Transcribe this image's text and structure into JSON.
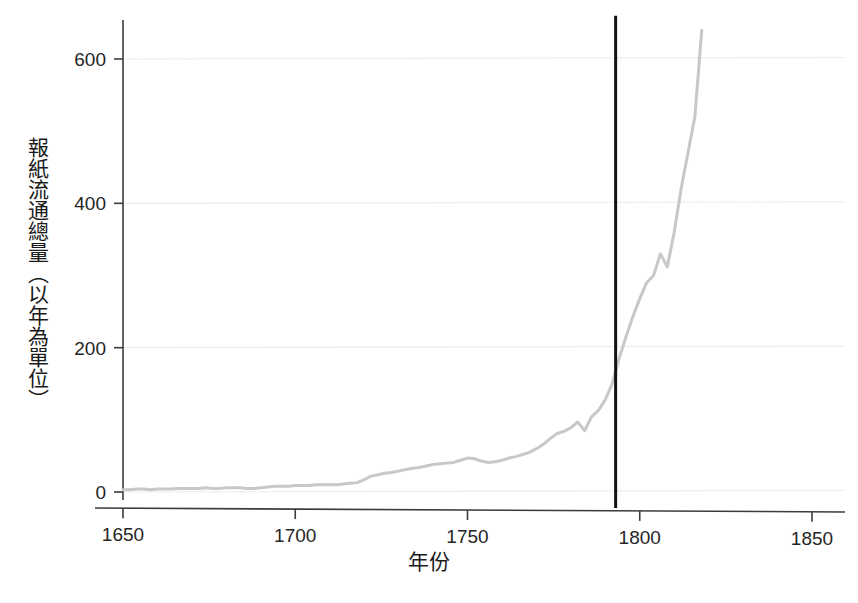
{
  "chart_data": {
    "type": "line",
    "title": "",
    "subtitle": "",
    "xlabel": "年份",
    "ylabel": "報紙流通總量（以年為單位）",
    "xlim": [
      1650,
      1850
    ],
    "ylim": [
      0,
      660
    ],
    "xticks": [
      1650,
      1700,
      1750,
      1800,
      1850
    ],
    "xticklabels": [
      "1650",
      "1700",
      "1750",
      "1800",
      "1850"
    ],
    "yticks": [
      0,
      200,
      400,
      600
    ],
    "yticklabels": [
      "0",
      "200",
      "400",
      "600"
    ],
    "grid": true,
    "grid_axis": "y",
    "legend": null,
    "legend_position": "none",
    "line_color": "#c8c8c8",
    "line_width": 3,
    "annotation_color": "#111111",
    "axis_color": "#3c3c3c",
    "grid_color": "#ededed",
    "background_color": "#ffffff",
    "annotations": [
      {
        "name": "vertical-marker",
        "type": "vline",
        "x": 1793,
        "y_range": [
          0,
          660
        ],
        "color": "#111111",
        "width": 3,
        "label": ""
      }
    ],
    "series": [
      {
        "name": "newspaper-circulation",
        "color": "#c8c8c8",
        "x": [
          1650,
          1652,
          1654,
          1656,
          1658,
          1660,
          1662,
          1664,
          1666,
          1668,
          1670,
          1672,
          1674,
          1676,
          1678,
          1680,
          1682,
          1684,
          1686,
          1688,
          1690,
          1692,
          1694,
          1696,
          1698,
          1700,
          1702,
          1704,
          1706,
          1708,
          1710,
          1712,
          1714,
          1716,
          1718,
          1720,
          1722,
          1724,
          1726,
          1728,
          1730,
          1732,
          1734,
          1736,
          1738,
          1740,
          1742,
          1744,
          1746,
          1748,
          1750,
          1752,
          1754,
          1756,
          1758,
          1760,
          1762,
          1764,
          1766,
          1768,
          1770,
          1772,
          1774,
          1776,
          1778,
          1780,
          1782,
          1784,
          1786,
          1788,
          1790,
          1792,
          1794,
          1796,
          1798,
          1800,
          1802,
          1804,
          1806,
          1808,
          1810,
          1812,
          1814,
          1816,
          1818
        ],
        "y": [
          3,
          3,
          4,
          4,
          3,
          4,
          4,
          4,
          5,
          5,
          5,
          5,
          6,
          5,
          5,
          6,
          6,
          6,
          5,
          5,
          6,
          7,
          8,
          8,
          8,
          9,
          9,
          9,
          10,
          10,
          10,
          10,
          11,
          12,
          13,
          17,
          22,
          24,
          26,
          27,
          29,
          31,
          33,
          34,
          36,
          38,
          39,
          40,
          41,
          44,
          47,
          46,
          43,
          41,
          42,
          44,
          47,
          49,
          52,
          55,
          60,
          66,
          74,
          81,
          84,
          89,
          97,
          85,
          104,
          113,
          128,
          150,
          185,
          215,
          243,
          268,
          290,
          300,
          330,
          312,
          360,
          420,
          470,
          520,
          640
        ]
      }
    ]
  },
  "axes": {
    "x_tick_labels": [
      "1650",
      "1700",
      "1750",
      "1800",
      "1850"
    ],
    "y_tick_labels": [
      "0",
      "200",
      "400",
      "600"
    ],
    "x_axis_title": "年份",
    "y_axis_title": "報紙流通總量（以年為單位）"
  }
}
